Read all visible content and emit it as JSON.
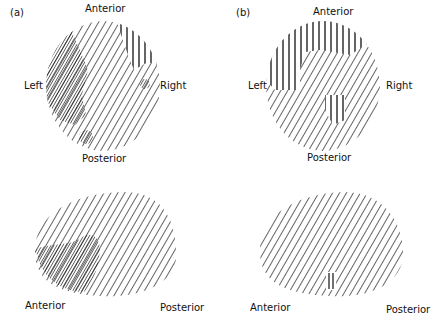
{
  "panels": [
    {
      "id": "a",
      "tag": "(a)",
      "top_view": {
        "anterior": "Anterior",
        "posterior": "Posterior",
        "left": "Left",
        "right": "Right"
      },
      "lateral_view": {
        "anterior": "Anterior",
        "posterior": "Posterior"
      }
    },
    {
      "id": "b",
      "tag": "(b)",
      "top_view": {
        "anterior": "Anterior",
        "posterior": "Posterior",
        "left": "Left",
        "right": "Right"
      },
      "lateral_view": {
        "anterior": "Anterior",
        "posterior": "Posterior"
      }
    }
  ],
  "colors": {
    "ink": "#111111",
    "background": "#ffffff"
  }
}
